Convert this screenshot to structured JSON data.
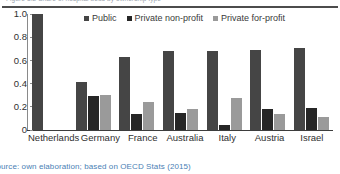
{
  "header": {
    "clipped_text": "Figure 3.2   Share of hospital beds by ownership type"
  },
  "caption": {
    "text": "Source: own elaboration; based on OECD Stats (2015)"
  },
  "legend": {
    "items": [
      {
        "label": "Public",
        "color": "#454545",
        "swatch_name": "legend-swatch-public"
      },
      {
        "label": "Private non-profit",
        "color": "#262626",
        "swatch_name": "legend-swatch-private-non-profit"
      },
      {
        "label": "Private for-profit",
        "color": "#9a9a9a",
        "swatch_name": "legend-swatch-private-for-profit"
      }
    ]
  },
  "chart_data": {
    "type": "bar",
    "title": "",
    "xlabel": "",
    "ylabel": "",
    "ylim": [
      0,
      1.0
    ],
    "yticks": [
      "0",
      "0.2",
      "0.4",
      "0.6",
      "0.8",
      "1.0"
    ],
    "ytick_values": [
      0,
      0.2,
      0.4,
      0.6,
      0.8,
      1.0
    ],
    "grid": false,
    "legend_position": "top",
    "categories": [
      "Netherlands",
      "Germany",
      "France",
      "Australia",
      "Italy",
      "Austria",
      "Israel"
    ],
    "series": [
      {
        "name": "Public",
        "color": "#454545",
        "values": [
          1.0,
          0.41,
          0.63,
          0.68,
          0.68,
          0.69,
          0.71
        ]
      },
      {
        "name": "Private non-profit",
        "color": "#262626",
        "values": [
          0.0,
          0.29,
          0.14,
          0.145,
          0.04,
          0.18,
          0.19
        ]
      },
      {
        "name": "Private for-profit",
        "color": "#9a9a9a",
        "values": [
          0.0,
          0.3,
          0.24,
          0.18,
          0.28,
          0.135,
          0.115
        ]
      }
    ]
  }
}
